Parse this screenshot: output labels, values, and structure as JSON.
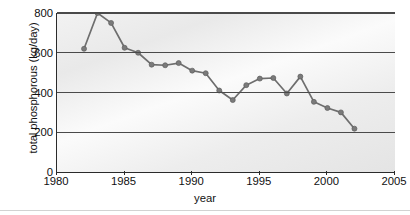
{
  "chart_data": {
    "type": "line",
    "title": "",
    "xlabel": "year",
    "ylabel": "total phosphorous (kg/day)",
    "xlim": [
      1980,
      2005
    ],
    "ylim": [
      0,
      800
    ],
    "xticks": [
      1980,
      1985,
      1990,
      1995,
      2000,
      2005
    ],
    "yticks": [
      0,
      200,
      400,
      600,
      800
    ],
    "gridlines": [
      200,
      400,
      600,
      800
    ],
    "grid": true,
    "legend": false,
    "marker": "circle",
    "line_color": "#6e6e6e",
    "marker_color": "#7a7a7a",
    "x": [
      1982,
      1983,
      1984,
      1985,
      1986,
      1987,
      1988,
      1989,
      1990,
      1991,
      1992,
      1993,
      1994,
      1995,
      1996,
      1997,
      1998,
      1999,
      2000,
      2001,
      2002
    ],
    "values": [
      620,
      800,
      750,
      625,
      600,
      540,
      537,
      548,
      510,
      497,
      410,
      362,
      437,
      470,
      473,
      395,
      480,
      353,
      322,
      300,
      218
    ],
    "series": [
      {
        "name": "total phosphorous",
        "x": [
          1982,
          1983,
          1984,
          1985,
          1986,
          1987,
          1988,
          1989,
          1990,
          1991,
          1992,
          1993,
          1994,
          1995,
          1996,
          1997,
          1998,
          1999,
          2000,
          2001,
          2002
        ],
        "values": [
          620,
          800,
          750,
          625,
          600,
          540,
          537,
          548,
          510,
          497,
          410,
          362,
          437,
          470,
          473,
          395,
          480,
          353,
          322,
          300,
          218
        ]
      }
    ]
  },
  "axes": {
    "y_tick_labels": [
      "800",
      "600",
      "400",
      "200",
      "0"
    ],
    "x_tick_labels": [
      "1980",
      "1985",
      "1990",
      "1995",
      "2000",
      "2005"
    ]
  }
}
